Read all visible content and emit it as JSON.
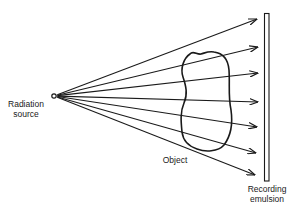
{
  "diagram": {
    "labels": {
      "source_line1": "Radiation",
      "source_line2": "source",
      "object": "Object",
      "emulsion_line1": "Recording",
      "emulsion_line2": "emulsion"
    },
    "source": {
      "x": 54,
      "y": 96,
      "r": 2.2,
      "icon": "open-circle"
    },
    "rays": [
      {
        "x2": 257,
        "y2": 19
      },
      {
        "x2": 258,
        "y2": 47
      },
      {
        "x2": 258,
        "y2": 73
      },
      {
        "x2": 258,
        "y2": 102
      },
      {
        "x2": 257,
        "y2": 127
      },
      {
        "x2": 256,
        "y2": 153
      },
      {
        "x2": 255,
        "y2": 175
      }
    ],
    "emulsion": {
      "x": 264,
      "y": 13,
      "width": 5,
      "height": 168
    },
    "colors": {
      "stroke": "#1a1a1a",
      "background": "#ffffff"
    }
  }
}
